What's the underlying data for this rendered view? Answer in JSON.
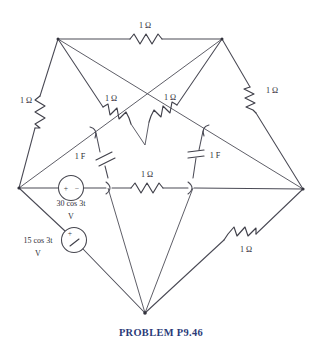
{
  "figure": {
    "title": "PROBLEM P9.46",
    "type": "electrical-circuit-schematic",
    "topology": "pentagram / five-pointed star network",
    "line_color": "#4a4a55",
    "caption_color": "#2b3a78",
    "background": "#ffffff"
  },
  "components": {
    "top_resistor": {
      "label": "1 Ω",
      "kind": "resistor",
      "value": "1",
      "unit": "Ω"
    },
    "left_resistor": {
      "label": "1 Ω",
      "kind": "resistor",
      "value": "1",
      "unit": "Ω"
    },
    "right_resistor": {
      "label": "1 Ω",
      "kind": "resistor",
      "value": "1",
      "unit": "Ω"
    },
    "mid_left_resistor": {
      "label": "1 Ω",
      "kind": "resistor",
      "value": "1",
      "unit": "Ω"
    },
    "mid_right_resistor": {
      "label": "1 Ω",
      "kind": "resistor",
      "value": "1",
      "unit": "Ω"
    },
    "center_resistor": {
      "label": "1 Ω",
      "kind": "resistor",
      "value": "1",
      "unit": "Ω"
    },
    "bottom_right_resistor": {
      "label": "1 Ω",
      "kind": "resistor",
      "value": "1",
      "unit": "Ω"
    },
    "left_capacitor": {
      "label": "1 F",
      "kind": "capacitor",
      "value": "1",
      "unit": "F"
    },
    "right_capacitor": {
      "label": "1 F",
      "kind": "capacitor",
      "value": "1",
      "unit": "F"
    },
    "source_30": {
      "kind": "independent-voltage-source",
      "amplitude_line": "30 cos 3t",
      "unit_line": "V",
      "plus": "+",
      "minus": "−"
    },
    "source_15": {
      "kind": "independent-voltage-source",
      "amplitude_line": "15 cos 3t",
      "unit_line": "V",
      "plus": "+",
      "minus": "−"
    }
  },
  "nodes": {
    "top_left": {
      "x": 58,
      "y": 39
    },
    "top_right": {
      "x": 222,
      "y": 39
    },
    "left": {
      "x": 19,
      "y": 188
    },
    "right": {
      "x": 303,
      "y": 189
    },
    "bottom": {
      "x": 145,
      "y": 313
    },
    "inner_top_left": {
      "x": 96,
      "y": 133
    },
    "inner_top_right": {
      "x": 203,
      "y": 131
    },
    "inner_bottom_left": {
      "x": 110,
      "y": 188
    },
    "inner_bottom_right": {
      "x": 192,
      "y": 188
    }
  }
}
